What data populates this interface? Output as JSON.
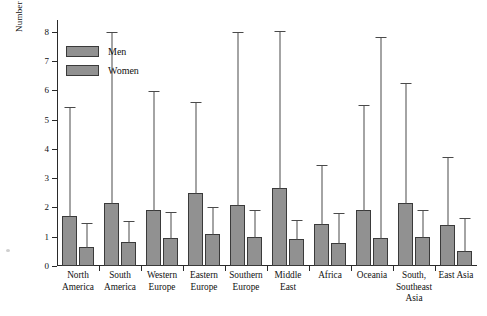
{
  "chart_data": {
    "type": "bar",
    "title": "",
    "xlabel": "",
    "ylabel": "Number of partners desired",
    "ylim": [
      0,
      8.4
    ],
    "yticks": [
      0,
      1,
      2,
      3,
      4,
      5,
      6,
      7,
      8
    ],
    "ytick_labels": [
      "0",
      "1",
      "2",
      "3",
      "4",
      "5",
      "6",
      "7",
      "8"
    ],
    "grid": false,
    "legend_position": "upper-left",
    "bar_color": "#919191",
    "bar_edge_color": "#3a3a3a",
    "error_bar_color": "#4a4a4a",
    "axis_color": "#2a2a2a",
    "categories": [
      "North America",
      "South America",
      "Western Europe",
      "Eastern Europe",
      "Southern Europe",
      "Middle East",
      "Africa",
      "Oceania",
      "South, Southeast Asia",
      "East Asia"
    ],
    "category_lines": [
      [
        "North",
        "America"
      ],
      [
        "South",
        "America"
      ],
      [
        "Western",
        "Europe"
      ],
      [
        "Eastern",
        "Europe"
      ],
      [
        "Southern",
        "Europe"
      ],
      [
        "Middle",
        "East"
      ],
      [
        "Africa"
      ],
      [
        "Oceania"
      ],
      [
        "South,",
        "Southeast",
        "Asia"
      ],
      [
        "East Asia"
      ]
    ],
    "series": [
      {
        "name": "Men",
        "values": [
          1.7,
          2.15,
          1.9,
          2.5,
          2.1,
          2.65,
          1.45,
          1.9,
          2.15,
          1.4
        ],
        "error_upper": [
          5.4,
          7.95,
          5.95,
          5.55,
          7.95,
          8.0,
          3.4,
          5.45,
          6.2,
          3.7
        ]
      },
      {
        "name": "Women",
        "values": [
          0.65,
          0.82,
          0.97,
          1.08,
          0.98,
          0.92,
          0.78,
          0.95,
          1.0,
          0.5
        ],
        "error_upper": [
          1.45,
          1.52,
          1.8,
          1.98,
          1.88,
          1.55,
          1.78,
          7.8,
          1.88,
          1.62
        ]
      }
    ]
  },
  "legend": {
    "entries": [
      {
        "label": "Men"
      },
      {
        "label": "Women"
      }
    ]
  }
}
